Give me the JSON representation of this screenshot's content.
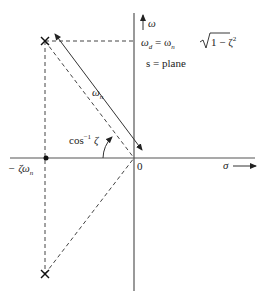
{
  "diagram": {
    "axes": {
      "vertical_label": "ω",
      "horizontal_label": "σ",
      "origin_label": "0"
    },
    "labels": {
      "omega_n": "ω",
      "omega_n_sub": "n",
      "damped_freq_lhs": "ω",
      "damped_freq_lhs_sub": "d",
      "damped_freq_eq": " = ω",
      "damped_freq_rhs_sub": "n",
      "damped_freq_sqrt_body": "1 − ζ",
      "damped_freq_sqrt_exp": "2",
      "plane": "s = plane",
      "angle": "cos",
      "angle_exp": "−1",
      "angle_var": " ζ",
      "real_part": "− ζω",
      "real_part_sub": "n"
    },
    "points": {
      "origin": [
        134,
        158
      ],
      "upper_pole": [
        45,
        41
      ],
      "lower_pole": [
        45,
        274
      ],
      "real_part_point": [
        46,
        158
      ]
    },
    "colors": {
      "axis": "#555555",
      "line": "#333333",
      "text": "#222222"
    }
  }
}
